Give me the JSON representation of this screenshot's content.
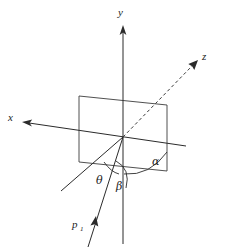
{
  "figure": {
    "background_color": "#ffffff",
    "stroke_color": "#2b2b2b",
    "axes": [
      {
        "id": "y-axis",
        "label": "y",
        "style": "solid",
        "arrow": "up",
        "label_x": 118,
        "label_y": 16
      },
      {
        "id": "x-axis",
        "label": "x",
        "style": "solid",
        "arrow": "left",
        "label_x": 8,
        "label_y": 121
      },
      {
        "id": "z-axis",
        "label": "z",
        "style": "dashed",
        "arrow": "up-right",
        "label_x": 202,
        "label_y": 60
      }
    ],
    "vectors": [
      {
        "id": "p1-vector",
        "label": "p",
        "subscript": "1",
        "style": "solid",
        "arrow": "up-right",
        "label_x": 72,
        "label_y": 228,
        "sub_x": 80,
        "sub_y": 231
      }
    ],
    "angles": [
      {
        "id": "alpha-angle",
        "label": "α",
        "label_x": 152,
        "label_y": 165,
        "description": "angle between z-axis and projection in plane"
      },
      {
        "id": "theta-angle",
        "label": "θ",
        "label_x": 96,
        "label_y": 184,
        "description": "angle between projection line and vector p1"
      },
      {
        "id": "beta-angle",
        "label": "β",
        "label_x": 116,
        "label_y": 190,
        "description": "angle between negative y-axis and vector p1"
      }
    ],
    "plane": {
      "id": "reference-plane",
      "shape": "parallelogram",
      "corners": [
        [
          79,
          96
        ],
        [
          167,
          105
        ],
        [
          167,
          171
        ],
        [
          79,
          162
        ]
      ]
    },
    "origin": {
      "x": 123,
      "y": 137,
      "label": ""
    }
  }
}
